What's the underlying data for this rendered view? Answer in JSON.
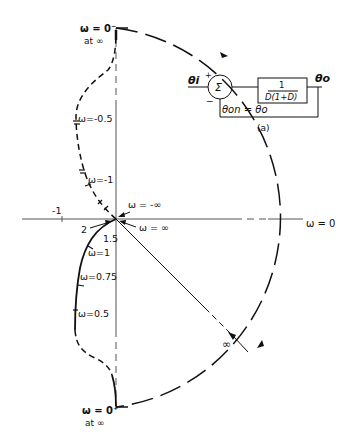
{
  "figure": {
    "type": "nyquist-plot",
    "caption": "(a)"
  },
  "axes": {
    "real_tick": "-1"
  },
  "labels": {
    "omega_0_minus": "ω = 0⁻",
    "omega_0_minus_sub": "at ∞",
    "omega_0_plus": "ω = 0⁺",
    "omega_0_plus_sub": "at ∞",
    "omega_m05": "ω=-0.5",
    "omega_m1": "ω=-1",
    "omega_minf": "ω = -∞",
    "omega_inf": "ω = ∞",
    "omega_0": "ω = 0",
    "omega_1": "ω=1",
    "omega_075": "ω=0.75",
    "omega_05": "ω=0.5",
    "label_2": "2",
    "label_15": "1.5",
    "infinity": "∞"
  },
  "block_diagram": {
    "input": "θi",
    "plus": "+",
    "minus": "−",
    "summer": "Σ",
    "tf_num": "1",
    "tf_den": "D(1+D)",
    "output": "θo",
    "feedback": "θon = θo",
    "caption": "(a)"
  },
  "colors": {
    "ink": "#111111",
    "axis": "#555555",
    "background": "#ffffff"
  }
}
